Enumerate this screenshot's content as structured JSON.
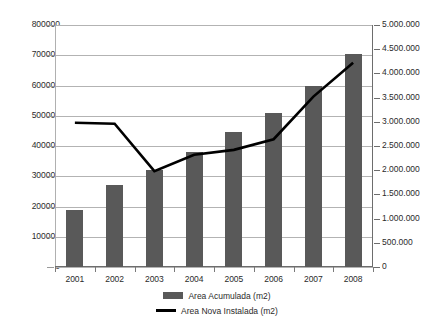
{
  "chart_data": {
    "type": "bar",
    "title": "",
    "subtitle": "",
    "xlabel": "",
    "ylabel": "",
    "categories": [
      "2001",
      "2002",
      "2003",
      "2004",
      "2005",
      "2006",
      "2007",
      "2008"
    ],
    "grid": true,
    "legend_position": "bottom",
    "axes": {
      "left": {
        "label": "",
        "min": 0,
        "max": 800000,
        "step": 100000,
        "ticks": [
          "0",
          "100000",
          "200000",
          "300000",
          "400000",
          "500000",
          "600000",
          "700000",
          "800000"
        ]
      },
      "right": {
        "label": "",
        "min": 0,
        "max": 5000000,
        "step": 500000,
        "ticks": [
          "0",
          "500.000",
          "1.000.000",
          "1.500.000",
          "2.000.000",
          "2.500.000",
          "3.000.000",
          "3.500.000",
          "4.000.000",
          "4.500.000",
          "5.000.000"
        ]
      }
    },
    "series": [
      {
        "name": "Area Acumulada (m2)",
        "kind": "bar",
        "axis": "left",
        "color": "#595959",
        "values": [
          190000,
          270000,
          320000,
          380000,
          445000,
          510000,
          600000,
          705000
        ]
      },
      {
        "name": "Area Nova Instalada (m2)",
        "kind": "line",
        "axis": "right",
        "color": "#000000",
        "values": [
          2980000,
          2960000,
          1980000,
          2320000,
          2420000,
          2640000,
          3520000,
          4220000
        ]
      }
    ]
  },
  "legend": {
    "entries": [
      {
        "label": "Area Acumulada (m2)",
        "marker": "bar-swatch"
      },
      {
        "label": "Area Nova Instalada (m2)",
        "marker": "line-swatch"
      }
    ]
  }
}
